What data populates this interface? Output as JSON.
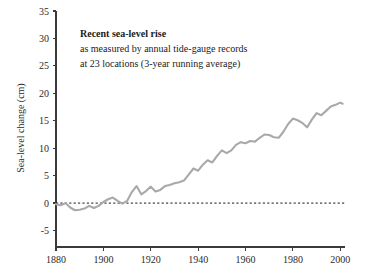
{
  "figure": {
    "background_color": "#ffffff",
    "width": 367,
    "height": 277
  },
  "chart_data": {
    "type": "line",
    "title": "Recent sea-level rise",
    "subtitle_lines": [
      "Recent sea-level rise",
      "as measured by annual tide-gauge records",
      "at 23 locations (3-year running average)"
    ],
    "annotation_line_1": "Recent sea-level rise",
    "annotation_line_2": "as measured by annual tide-gauge records",
    "annotation_line_3": "at 23 locations (3-year running average)",
    "xlabel": "",
    "ylabel": "Sea-level change (cm)",
    "xlim": [
      1880,
      2002
    ],
    "ylim": [
      -8,
      35
    ],
    "xticks": [
      1880,
      1900,
      1920,
      1940,
      1960,
      1980,
      2000
    ],
    "xtick_labels": [
      "1880",
      "1900",
      "1920",
      "1940",
      "1960",
      "1980",
      "2000"
    ],
    "yticks": [
      -5,
      0,
      5,
      10,
      15,
      20,
      25,
      30,
      35
    ],
    "ytick_labels": [
      "-5",
      "0",
      "5",
      "10",
      "15",
      "20",
      "25",
      "30",
      "35"
    ],
    "grid": false,
    "legend": "none",
    "reference_line": {
      "axis": "y",
      "value": 0,
      "style": "dashed",
      "color": "#1a1a1a"
    },
    "series": [
      {
        "name": "Sea-level change (3-year running average)",
        "color": "#a9a9a9",
        "units": "cm",
        "x": [
          1880,
          1882,
          1884,
          1886,
          1888,
          1890,
          1892,
          1894,
          1896,
          1898,
          1900,
          1902,
          1904,
          1906,
          1908,
          1910,
          1912,
          1914,
          1916,
          1918,
          1920,
          1922,
          1924,
          1926,
          1928,
          1930,
          1932,
          1934,
          1936,
          1938,
          1940,
          1942,
          1944,
          1946,
          1948,
          1950,
          1952,
          1954,
          1956,
          1958,
          1960,
          1962,
          1964,
          1966,
          1968,
          1970,
          1972,
          1974,
          1976,
          1978,
          1980,
          1982,
          1984,
          1986,
          1988,
          1990,
          1992,
          1994,
          1996,
          1998,
          2000,
          2001
        ],
        "values": [
          -0.2,
          -0.4,
          0.0,
          -0.8,
          -1.3,
          -1.2,
          -1.0,
          -0.5,
          -0.9,
          -0.5,
          0.2,
          0.7,
          1.0,
          0.4,
          -0.1,
          0.4,
          2.0,
          3.1,
          1.6,
          2.2,
          3.0,
          2.1,
          2.4,
          3.1,
          3.3,
          3.6,
          3.8,
          4.1,
          5.2,
          6.3,
          5.9,
          7.0,
          7.8,
          7.4,
          8.6,
          9.6,
          9.1,
          9.6,
          10.6,
          11.1,
          10.9,
          11.3,
          11.2,
          11.9,
          12.5,
          12.4,
          12.0,
          11.9,
          13.0,
          14.4,
          15.4,
          15.1,
          14.6,
          13.8,
          15.2,
          16.4,
          16.0,
          16.8,
          17.6,
          17.9,
          18.3,
          18.1
        ]
      }
    ]
  },
  "axes": {
    "y_axis_title": "Sea-level change (cm)"
  }
}
